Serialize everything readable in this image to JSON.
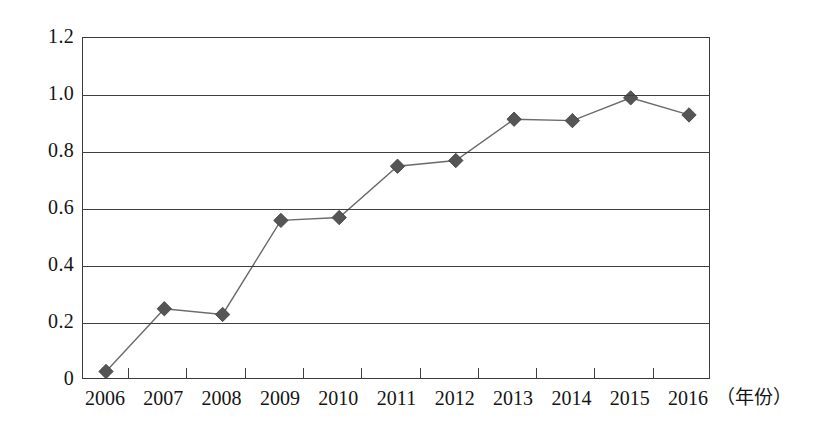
{
  "chart_data": {
    "type": "line",
    "title": "",
    "subtitle": "",
    "xlabel": "（年份）",
    "ylabel": "",
    "categories": [
      "2006",
      "2007",
      "2008",
      "2009",
      "2010",
      "2011",
      "2012",
      "2013",
      "2014",
      "2015",
      "2016"
    ],
    "values": [
      0.03,
      0.25,
      0.23,
      0.56,
      0.57,
      0.75,
      0.77,
      0.915,
      0.91,
      0.99,
      0.93
    ],
    "series": [
      {
        "name": "series-1",
        "values": [
          0.03,
          0.25,
          0.23,
          0.56,
          0.57,
          0.75,
          0.77,
          0.915,
          0.91,
          0.99,
          0.93
        ]
      }
    ],
    "ylim": [
      0,
      1.2
    ],
    "yticks": [
      "0",
      "0.2",
      "0.4",
      "0.6",
      "0.8",
      "1.0",
      "1.2"
    ],
    "ytick_values": [
      0,
      0.2,
      0.4,
      0.6,
      0.8,
      1.0,
      1.2
    ],
    "grid": true,
    "grid_axis": "y",
    "legend": false,
    "legend_position": "none",
    "marker": "diamond",
    "marker_color": "#555555",
    "line_color": "#6b6b6b",
    "axis_color": "#3f3f3f",
    "background": "#ffffff"
  },
  "axis": {
    "x_unit_label": "（年份）"
  }
}
